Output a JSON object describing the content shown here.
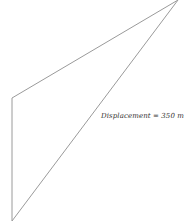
{
  "diagram": {
    "type": "displacement-triangle",
    "vertices": {
      "top_right": [
        178,
        0
      ],
      "left_top": [
        12,
        98
      ],
      "bottom_left": [
        12,
        221
      ]
    },
    "line_color": "#9a9a9a",
    "label": "Displacement = 350 m"
  }
}
